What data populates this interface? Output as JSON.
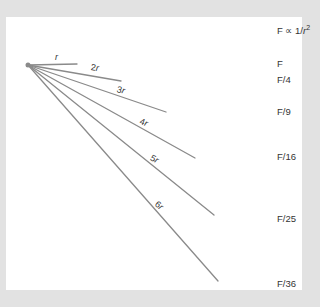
{
  "diagram": {
    "law": {
      "prefix": "F ∝ 1/",
      "var": "r",
      "exponent": "2"
    },
    "origin": {
      "x": 28,
      "y": 65
    },
    "rays": [
      {
        "multiplier": "",
        "var": "r",
        "force": "F",
        "end": {
          "x": 77,
          "y": 64
        },
        "label_pos": {
          "x": 55,
          "y": 52
        },
        "force_y": 58,
        "rot": 0
      },
      {
        "multiplier": "2",
        "var": "r",
        "force": "F/4",
        "end": {
          "x": 121,
          "y": 81
        },
        "label_pos": {
          "x": 91,
          "y": 62
        },
        "force_y": 74,
        "rot": 8
      },
      {
        "multiplier": "3",
        "var": "r",
        "force": "F/9",
        "end": {
          "x": 166,
          "y": 112
        },
        "label_pos": {
          "x": 117,
          "y": 84
        },
        "force_y": 106,
        "rot": 14
      },
      {
        "multiplier": "4",
        "var": "r",
        "force": "F/16",
        "end": {
          "x": 195,
          "y": 158
        },
        "label_pos": {
          "x": 140,
          "y": 116
        },
        "force_y": 151,
        "rot": 20
      },
      {
        "multiplier": "5",
        "var": "r",
        "force": "F/25",
        "end": {
          "x": 214,
          "y": 215
        },
        "label_pos": {
          "x": 151,
          "y": 152
        },
        "force_y": 213,
        "rot": 28
      },
      {
        "multiplier": "6",
        "var": "r",
        "force": "F/36",
        "end": {
          "x": 218,
          "y": 281
        },
        "label_pos": {
          "x": 156,
          "y": 198
        },
        "force_y": 278,
        "rot": 38
      }
    ]
  },
  "colors": {
    "background": "#e2e2e2",
    "panel": "#ffffff",
    "ray": "#8a8a8a",
    "text": "#333333"
  }
}
